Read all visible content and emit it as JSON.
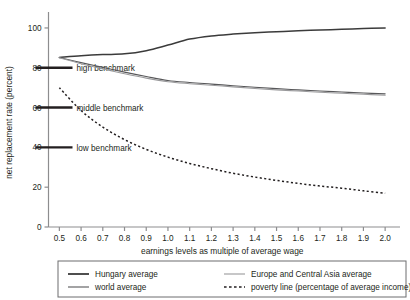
{
  "chart_data": {
    "type": "line",
    "title": "",
    "xlabel": "earnings levels as multiple of average wage",
    "ylabel": "net replacement rate (percent)",
    "xlim": [
      0.45,
      2.05
    ],
    "ylim": [
      0,
      105
    ],
    "grid": false,
    "legend_position": "bottom",
    "x": [
      0.5,
      0.6,
      0.7,
      0.8,
      0.9,
      1.0,
      1.1,
      1.2,
      1.3,
      1.4,
      1.5,
      1.6,
      1.7,
      1.8,
      1.9,
      2.0
    ],
    "xticks": [
      "0.5",
      "0.6",
      "0.7",
      "0.8",
      "0.9",
      "1.0",
      "1.1",
      "1.2",
      "1.3",
      "1.4",
      "1.5",
      "1.6",
      "1.7",
      "1.8",
      "1.9",
      "2.0"
    ],
    "yticks": [
      "0",
      "20",
      "40",
      "60",
      "80",
      "100"
    ],
    "ytick_values": [
      0,
      20,
      40,
      60,
      80,
      100
    ],
    "series": [
      {
        "name": "Hungary average",
        "style": "solid",
        "color": "#3b3b3b",
        "width": 1.5,
        "values": [
          85.2,
          86.0,
          86.6,
          87.0,
          88.6,
          91.4,
          94.4,
          96.0,
          96.9,
          97.6,
          98.1,
          98.6,
          99.0,
          99.3,
          99.7,
          100.0
        ]
      },
      {
        "name": "world average",
        "style": "solid",
        "color": "#58585a",
        "width": 1.1,
        "values": [
          85.2,
          82.6,
          80.2,
          77.8,
          75.6,
          73.6,
          72.6,
          71.8,
          71.0,
          70.2,
          69.5,
          68.9,
          68.3,
          67.8,
          67.3,
          66.9
        ]
      },
      {
        "name": "Europe and Central Asia average",
        "style": "solid",
        "color": "#9a9a9c",
        "width": 1.1,
        "values": [
          85.0,
          82.0,
          79.4,
          77.0,
          74.8,
          73.0,
          72.0,
          71.2,
          70.4,
          69.6,
          68.9,
          68.3,
          67.7,
          67.2,
          66.7,
          66.2
        ]
      },
      {
        "name": "poverty line (percentage of average income)",
        "style": "dotted",
        "color": "#231f20",
        "width": 1.5,
        "values": [
          70.0,
          58.5,
          50.2,
          43.9,
          39.0,
          35.1,
          31.9,
          29.3,
          27.0,
          25.1,
          23.4,
          21.9,
          20.6,
          19.5,
          18.2,
          17.0
        ]
      }
    ],
    "benchmarks": [
      {
        "label": "high benchmark",
        "value": 80
      },
      {
        "label": "middle benchmark",
        "value": 60
      },
      {
        "label": "low benchmark",
        "value": 40
      }
    ]
  },
  "legend": {
    "entries": [
      {
        "label": "Hungary average",
        "style": "solid",
        "color": "#3b3b3b",
        "width": 1.8
      },
      {
        "label": "Europe and Central Asia average",
        "style": "solid",
        "color": "#9a9a9c",
        "width": 1.1
      },
      {
        "label": "world average",
        "style": "solid",
        "color": "#58585a",
        "width": 1.1
      },
      {
        "label": "poverty line (percentage of average income)",
        "style": "dotted",
        "color": "#231f20",
        "width": 1.5
      }
    ]
  },
  "colors": {
    "axis": "#8d8d8f",
    "text": "#231f20",
    "legend_border": "#6d6d6f",
    "background": "#ffffff"
  }
}
